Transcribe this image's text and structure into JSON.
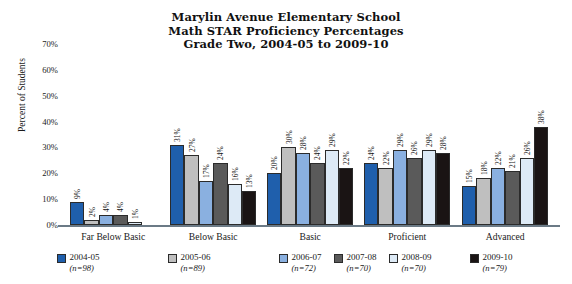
{
  "title": {
    "line1": "Marylin Avenue Elementary School",
    "line2": "Math STAR Proficiency Percentages",
    "line3": "Grade Two, 2004-05 to 2009-10"
  },
  "axis": {
    "ylabel": "Percent of Students",
    "yticks": [
      "0%",
      "10%",
      "20%",
      "30%",
      "40%",
      "50%",
      "60%",
      "70%"
    ]
  },
  "legend": [
    {
      "label": "2004-05",
      "n": "(n=98)",
      "color": "#1f5fac"
    },
    {
      "label": "2005-06",
      "n": "(n=89)",
      "color": "#bfbfbf"
    },
    {
      "label": "2006-07",
      "n": "(n=72)",
      "color": "#8ab0e0"
    },
    {
      "label": "2007-08",
      "n": "(n=70)",
      "color": "#5a5a5a"
    },
    {
      "label": "2008-09",
      "n": "(n=70)",
      "color": "#ddeaf6"
    },
    {
      "label": "2009-10",
      "n": "(n=79)",
      "color": "#1a1414"
    }
  ],
  "chart_data": {
    "type": "bar",
    "title": "Marylin Avenue Elementary School Math STAR Proficiency Percentages Grade Two, 2004-05 to 2009-10",
    "xlabel": "",
    "ylabel": "Percent of Students",
    "ylim": [
      0,
      70
    ],
    "grid": false,
    "legend_position": "bottom",
    "categories": [
      "Far Below Basic",
      "Below Basic",
      "Basic",
      "Proficient",
      "Advanced"
    ],
    "series": [
      {
        "name": "2004-05",
        "n": 98,
        "color": "#1f5fac",
        "values": [
          9,
          31,
          20,
          24,
          15
        ],
        "labels": [
          "9%",
          "31%",
          "20%",
          "24%",
          "15%"
        ]
      },
      {
        "name": "2005-06",
        "n": 89,
        "color": "#bfbfbf",
        "values": [
          2,
          27,
          30,
          22,
          18
        ],
        "labels": [
          "2%",
          "27%",
          "30%",
          "22%",
          "18%"
        ]
      },
      {
        "name": "2006-07",
        "n": 72,
        "color": "#8ab0e0",
        "values": [
          4,
          17,
          28,
          29,
          22
        ],
        "labels": [
          "4%",
          "17%",
          "28%",
          "29%",
          "22%"
        ]
      },
      {
        "name": "2007-08",
        "n": 70,
        "color": "#5a5a5a",
        "values": [
          4,
          24,
          24,
          26,
          21
        ],
        "labels": [
          "4%",
          "24%",
          "24%",
          "26%",
          "21%"
        ]
      },
      {
        "name": "2008-09",
        "n": 70,
        "color": "#ddeaf6",
        "values": [
          1,
          16,
          29,
          29,
          26
        ],
        "labels": [
          "1%",
          "16%",
          "29%",
          "29%",
          "26%"
        ]
      },
      {
        "name": "2009-10",
        "n": 79,
        "color": "#1a1414",
        "values": [
          0,
          13,
          22,
          28,
          38
        ],
        "labels": [
          "",
          "13%",
          "22%",
          "28%",
          "38%"
        ]
      }
    ]
  }
}
